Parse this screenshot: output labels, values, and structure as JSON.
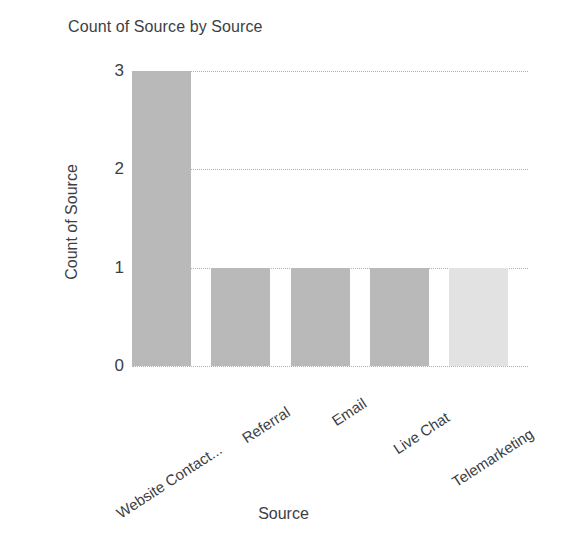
{
  "chart_data": {
    "type": "bar",
    "title": "Count of Source by Source",
    "xlabel": "Source",
    "ylabel": "Count of Source",
    "categories": [
      "Website Contact...",
      "Referral",
      "Email",
      "Live Chat",
      "Telemarketing"
    ],
    "values": [
      3,
      1,
      1,
      1,
      1
    ],
    "bar_colors": [
      "#b9b9b9",
      "#b9b9b9",
      "#b9b9b9",
      "#b9b9b9",
      "#e2e2e2"
    ],
    "ylim": [
      0,
      3
    ],
    "yticks": [
      0,
      1,
      2,
      3
    ],
    "ytick_labels": [
      "0",
      "1",
      "2",
      "3"
    ],
    "grid": true,
    "grid_style": "dotted",
    "grid_color": "#b0b0b0",
    "legend": "none",
    "background": "#ffffff",
    "text_color": "#3c4043",
    "xtick_rotation": -33
  },
  "axes": {
    "y_title": "Count of Source",
    "x_title": "Source"
  },
  "header": {
    "title": "Count of Source by Source"
  }
}
